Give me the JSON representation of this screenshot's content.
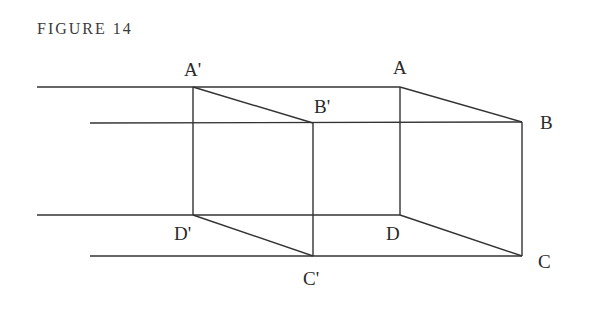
{
  "figure": {
    "title": "FIGURE 14",
    "line_color": "#333333",
    "label_color": "#2a2a2a"
  },
  "points": {
    "A_prime": {
      "label": "A'",
      "x": 193,
      "y": 87
    },
    "B_prime": {
      "label": "B'",
      "x": 313,
      "y": 123
    },
    "C_prime": {
      "label": "C'",
      "x": 313,
      "y": 256
    },
    "D_prime": {
      "label": "D'",
      "x": 193,
      "y": 215
    },
    "A": {
      "label": "A",
      "x": 400,
      "y": 87
    },
    "B": {
      "label": "B",
      "x": 522,
      "y": 122
    },
    "C": {
      "label": "C",
      "x": 522,
      "y": 256
    },
    "D": {
      "label": "D",
      "x": 400,
      "y": 215
    }
  },
  "labels": {
    "A_prime": "A'",
    "B_prime": "B'",
    "C_prime": "C'",
    "D_prime": "D'",
    "A": "A",
    "B": "B",
    "C": "C",
    "D": "D"
  }
}
